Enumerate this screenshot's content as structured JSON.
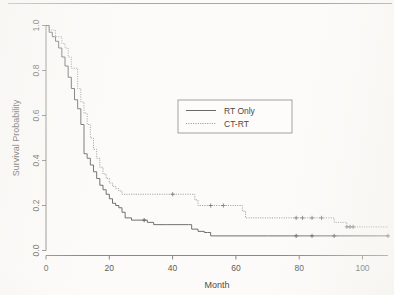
{
  "figure": {
    "kind": "kaplan-meier-survival-plot",
    "background_color": "#fcfbf9",
    "line_color": "#6b6966",
    "dotted_color": "#9d9b97"
  },
  "chart_data": {
    "type": "line",
    "title": "",
    "subtitle": "",
    "xlabel": "Month",
    "ylabel": "Survival Probability",
    "xlim": [
      0,
      108
    ],
    "ylim": [
      0.0,
      1.0
    ],
    "xticks": [
      0,
      20,
      40,
      60,
      80,
      100
    ],
    "xtick_labels": [
      "0",
      "20",
      "40",
      "60",
      "80",
      "100"
    ],
    "yticks": [
      0.0,
      0.2,
      0.4,
      0.6,
      0.8,
      1.0
    ],
    "ytick_labels": [
      "0.0",
      "0.2",
      "0.4",
      "0.6",
      "0.8",
      "1.0"
    ],
    "grid": false,
    "legend_position": "center-right-upper",
    "legend_entries": [
      {
        "name": "RT Only",
        "style": "solid",
        "color": "#6b6966"
      },
      {
        "name": "CT-RT",
        "style": "dotted",
        "color": "#9d9b97"
      }
    ],
    "series": [
      {
        "name": "RT Only",
        "style": "solid",
        "step": "post",
        "x": [
          0,
          1,
          2,
          3,
          4,
          5,
          6,
          7,
          8,
          9,
          10,
          11,
          12,
          13,
          14,
          15,
          16,
          17,
          18,
          19,
          20,
          21,
          22,
          23,
          24,
          25,
          27,
          29,
          31,
          32,
          34,
          38,
          42,
          45,
          46,
          48,
          50,
          51,
          52,
          60,
          70,
          79,
          84,
          91,
          100,
          108
        ],
        "y": [
          1.0,
          0.97,
          0.95,
          0.93,
          0.9,
          0.86,
          0.82,
          0.77,
          0.72,
          0.67,
          0.63,
          0.56,
          0.43,
          0.41,
          0.38,
          0.35,
          0.32,
          0.29,
          0.27,
          0.25,
          0.23,
          0.21,
          0.2,
          0.19,
          0.17,
          0.145,
          0.135,
          0.135,
          0.135,
          0.125,
          0.115,
          0.115,
          0.115,
          0.115,
          0.095,
          0.085,
          0.08,
          0.08,
          0.065,
          0.065,
          0.065,
          0.065,
          0.065,
          0.065,
          0.065,
          0.065
        ],
        "censored_x": [
          31,
          79,
          84,
          91,
          108
        ],
        "censored_y": [
          0.135,
          0.065,
          0.065,
          0.065,
          0.065
        ]
      },
      {
        "name": "CT-RT",
        "style": "dotted",
        "step": "post",
        "x": [
          0,
          1,
          3,
          5,
          6,
          7,
          8,
          10,
          11,
          12,
          13,
          14,
          15,
          16,
          17,
          18,
          19,
          20,
          21,
          22,
          23,
          24,
          30,
          40,
          47,
          48,
          52,
          56,
          60,
          62,
          63,
          70,
          79,
          81,
          84,
          87,
          91,
          95,
          97,
          108
        ],
        "y": [
          1.0,
          0.98,
          0.95,
          0.92,
          0.9,
          0.86,
          0.81,
          0.72,
          0.66,
          0.61,
          0.56,
          0.5,
          0.45,
          0.41,
          0.37,
          0.34,
          0.32,
          0.3,
          0.285,
          0.275,
          0.265,
          0.25,
          0.25,
          0.25,
          0.225,
          0.2,
          0.2,
          0.2,
          0.2,
          0.175,
          0.145,
          0.145,
          0.145,
          0.145,
          0.145,
          0.145,
          0.125,
          0.105,
          0.105,
          0.105
        ],
        "censored_x": [
          40,
          52,
          56,
          79,
          81,
          84,
          87,
          95,
          96,
          97
        ],
        "censored_y": [
          0.25,
          0.2,
          0.2,
          0.145,
          0.145,
          0.145,
          0.145,
          0.105,
          0.105,
          0.105
        ]
      }
    ]
  }
}
